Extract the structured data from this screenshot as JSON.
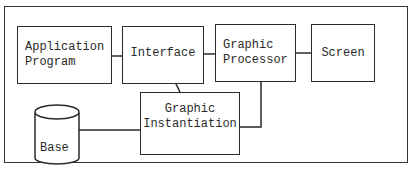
{
  "diagram": {
    "type": "block-diagram",
    "nodes": [
      {
        "id": "application_program",
        "label": "Application\nProgram",
        "shape": "rectangle"
      },
      {
        "id": "interface",
        "label": "Interface",
        "shape": "rectangle"
      },
      {
        "id": "graphic_processor",
        "label": "Graphic\nProcessor",
        "shape": "rectangle"
      },
      {
        "id": "screen",
        "label": "Screen",
        "shape": "rectangle"
      },
      {
        "id": "graphic_instantiation",
        "label": "Graphic\nInstantiation",
        "shape": "rectangle"
      },
      {
        "id": "base",
        "label": "Base",
        "shape": "cylinder"
      }
    ],
    "edges": [
      {
        "from": "application_program",
        "to": "interface"
      },
      {
        "from": "interface",
        "to": "graphic_processor"
      },
      {
        "from": "graphic_processor",
        "to": "screen"
      },
      {
        "from": "interface",
        "to": "graphic_instantiation"
      },
      {
        "from": "graphic_processor",
        "to": "graphic_instantiation"
      },
      {
        "from": "base",
        "to": "graphic_instantiation"
      }
    ]
  },
  "labels": {
    "application_program": "Application\nProgram",
    "interface": "Interface",
    "graphic_processor": "Graphic\nProcessor",
    "screen": "Screen",
    "graphic_instantiation": "Graphic\nInstantiation",
    "base": "Base"
  }
}
